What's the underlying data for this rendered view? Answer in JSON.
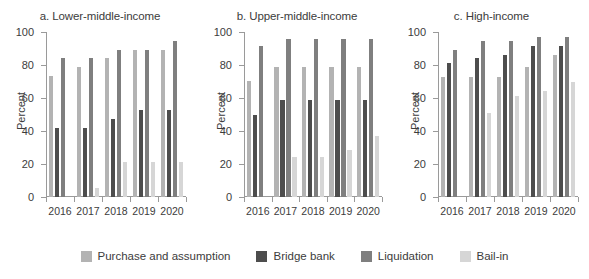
{
  "chart_data": {
    "type": "bar",
    "title": "",
    "ylabel": "Percent",
    "xlabel": "",
    "ylim": [
      0,
      100
    ],
    "yticks": [
      0,
      20,
      40,
      60,
      80,
      100
    ],
    "categories": [
      "2016",
      "2017",
      "2018",
      "2019",
      "2020"
    ],
    "grid": false,
    "legend_position": "bottom",
    "legend": [
      {
        "name": "Purchase and assumption",
        "color": "#b3b3b3"
      },
      {
        "name": "Bridge bank",
        "color": "#4d4d4d"
      },
      {
        "name": "Liquidation",
        "color": "#7f7f7f"
      },
      {
        "name": "Bail-in",
        "color": "#d6d6d6"
      }
    ],
    "panels": [
      {
        "id": "a",
        "title": "a. Lower-middle-income",
        "series": [
          {
            "name": "Purchase and assumption",
            "color": "#b3b3b3",
            "values": [
              73.5,
              79.0,
              84.0,
              89.0,
              89.0
            ]
          },
          {
            "name": "Bridge bank",
            "color": "#4d4d4d",
            "values": [
              42.0,
              42.0,
              47.5,
              52.5,
              52.5
            ]
          },
          {
            "name": "Liquidation",
            "color": "#7f7f7f",
            "values": [
              84.0,
              84.0,
              89.0,
              89.0,
              94.5
            ]
          },
          {
            "name": "Bail-in",
            "color": "#d6d6d6",
            "values": [
              0,
              5.5,
              21.0,
              21.0,
              21.0
            ]
          }
        ]
      },
      {
        "id": "b",
        "title": "b. Upper-middle-income",
        "series": [
          {
            "name": "Purchase and assumption",
            "color": "#b3b3b3",
            "values": [
              70.5,
              79.0,
              79.0,
              79.0,
              79.0
            ]
          },
          {
            "name": "Bridge bank",
            "color": "#4d4d4d",
            "values": [
              50.0,
              58.5,
              58.5,
              58.5,
              58.5
            ]
          },
          {
            "name": "Liquidation",
            "color": "#7f7f7f",
            "values": [
              91.5,
              95.5,
              95.5,
              95.5,
              95.5
            ]
          },
          {
            "name": "Bail-in",
            "color": "#d6d6d6",
            "values": [
              0,
              24.5,
              24.5,
              28.5,
              37.0
            ]
          }
        ]
      },
      {
        "id": "c",
        "title": "c. High-income",
        "series": [
          {
            "name": "Purchase and assumption",
            "color": "#b3b3b3",
            "values": [
              72.5,
              72.5,
              72.5,
              78.5,
              86.0
            ]
          },
          {
            "name": "Bridge bank",
            "color": "#4d4d4d",
            "values": [
              81.0,
              84.0,
              86.0,
              91.5,
              91.5
            ]
          },
          {
            "name": "Liquidation",
            "color": "#7f7f7f",
            "values": [
              89.0,
              94.5,
              94.5,
              97.0,
              97.0
            ]
          },
          {
            "name": "Bail-in",
            "color": "#d6d6d6",
            "values": [
              0,
              51.0,
              61.5,
              64.5,
              70.0
            ]
          }
        ]
      }
    ]
  }
}
